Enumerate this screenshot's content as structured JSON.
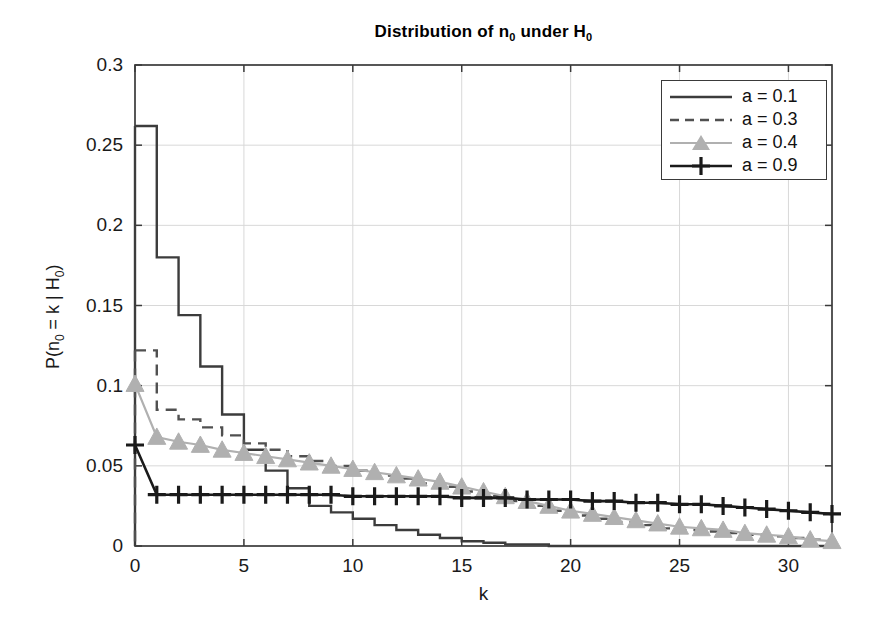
{
  "chart_data": {
    "type": "line",
    "title_parts": {
      "pre": "Distribution of n",
      "sub1": "0",
      "mid": " under H",
      "sub2": "0"
    },
    "xlabel": "k",
    "ylabel": "P(n_0 = k | H_0)",
    "ylabel_parts": {
      "pre": "P(n",
      "sub1": "0",
      "mid": " = k | H",
      "sub2": "0",
      "post": ")"
    },
    "xlim": [
      0,
      32
    ],
    "ylim": [
      0,
      0.3
    ],
    "xticks": [
      0,
      5,
      10,
      15,
      20,
      25,
      30
    ],
    "yticks": [
      0,
      0.05,
      0.1,
      0.15,
      0.2,
      0.25,
      0.3
    ],
    "xtick_labels": [
      "0",
      "5",
      "10",
      "15",
      "20",
      "25",
      "30"
    ],
    "ytick_labels": [
      "0",
      "0.05",
      "0.1",
      "0.15",
      "0.2",
      "0.25",
      "0.3"
    ],
    "grid": true,
    "legend_position": "upper right",
    "x": [
      0,
      1,
      2,
      3,
      4,
      5,
      6,
      7,
      8,
      9,
      10,
      11,
      12,
      13,
      14,
      15,
      16,
      17,
      18,
      19,
      20,
      21,
      22,
      23,
      24,
      25,
      26,
      27,
      28,
      29,
      30,
      31,
      32
    ],
    "series": [
      {
        "name": "a = 0.1",
        "label": "a = 0.1",
        "style": "solid",
        "marker": "none",
        "color": "#3c3c3c",
        "linewidth": 2.4,
        "drawstyle": "steps-post",
        "values": [
          0.262,
          0.18,
          0.144,
          0.112,
          0.082,
          0.06,
          0.047,
          0.036,
          0.025,
          0.021,
          0.017,
          0.013,
          0.01,
          0.007,
          0.005,
          0.003,
          0.002,
          0.001,
          0.001,
          0.0,
          0.0,
          0.0,
          0.0,
          0.0,
          0.0,
          0.0,
          0.0,
          0.0,
          0.0,
          0.0,
          0.0,
          0.0,
          0.0
        ]
      },
      {
        "name": "a = 0.3",
        "label": "a = 0.3",
        "style": "dashed",
        "marker": "none",
        "color": "#505050",
        "linewidth": 2.4,
        "drawstyle": "steps-post",
        "values": [
          0.122,
          0.085,
          0.079,
          0.074,
          0.069,
          0.064,
          0.06,
          0.056,
          0.053,
          0.05,
          0.047,
          0.044,
          0.042,
          0.039,
          0.037,
          0.034,
          0.031,
          0.028,
          0.025,
          0.022,
          0.019,
          0.017,
          0.015,
          0.013,
          0.011,
          0.01,
          0.009,
          0.008,
          0.007,
          0.006,
          0.005,
          0.004,
          0.003
        ]
      },
      {
        "name": "a = 0.4",
        "label": "a = 0.4",
        "style": "solid",
        "marker": "triangle",
        "color": "#b0b0b0",
        "linewidth": 2.2,
        "drawstyle": "line",
        "values": [
          0.101,
          0.068,
          0.065,
          0.063,
          0.06,
          0.058,
          0.056,
          0.054,
          0.052,
          0.05,
          0.048,
          0.046,
          0.044,
          0.042,
          0.04,
          0.037,
          0.034,
          0.031,
          0.028,
          0.025,
          0.022,
          0.02,
          0.018,
          0.016,
          0.014,
          0.012,
          0.011,
          0.01,
          0.008,
          0.007,
          0.006,
          0.004,
          0.003
        ]
      },
      {
        "name": "a = 0.9",
        "label": "a = 0.9",
        "style": "solid",
        "marker": "plus",
        "color": "#1a1a1a",
        "linewidth": 2.6,
        "drawstyle": "line",
        "values": [
          0.063,
          0.032,
          0.032,
          0.032,
          0.032,
          0.032,
          0.032,
          0.032,
          0.032,
          0.032,
          0.031,
          0.031,
          0.031,
          0.031,
          0.031,
          0.03,
          0.03,
          0.03,
          0.029,
          0.029,
          0.029,
          0.028,
          0.028,
          0.027,
          0.027,
          0.026,
          0.026,
          0.025,
          0.024,
          0.023,
          0.022,
          0.021,
          0.02
        ]
      }
    ]
  },
  "legend": {
    "entries": [
      {
        "label": "a = 0.1"
      },
      {
        "label": "a = 0.3"
      },
      {
        "label": "a = 0.4"
      },
      {
        "label": "a = 0.9"
      }
    ]
  }
}
